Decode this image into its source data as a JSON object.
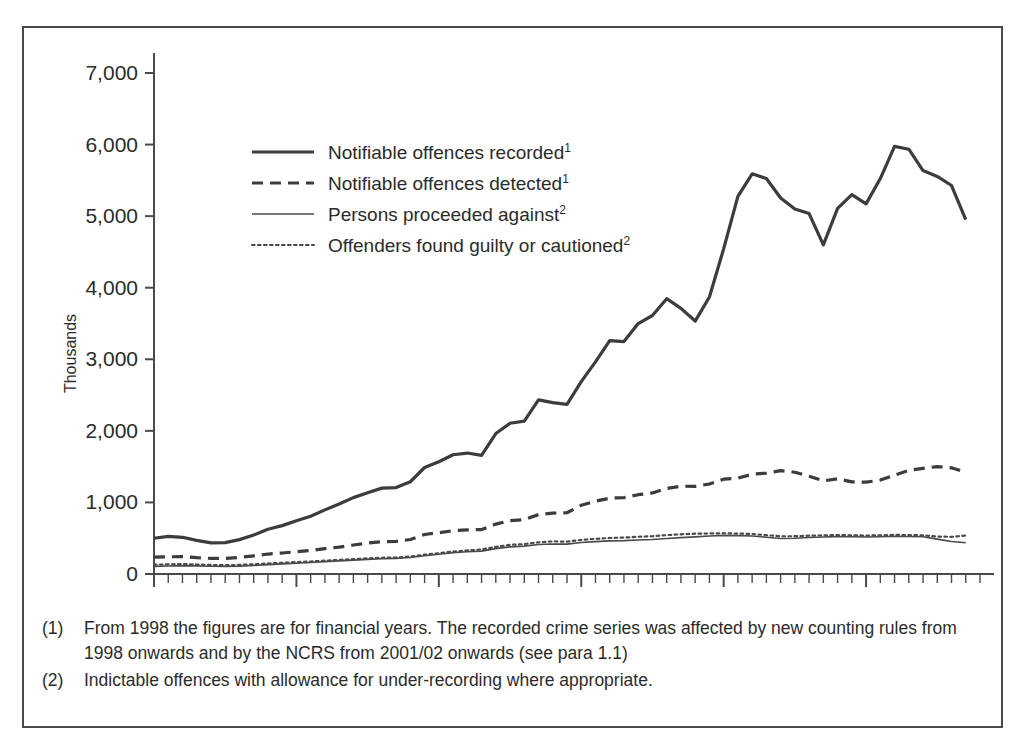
{
  "chart_data": {
    "type": "line",
    "title": "",
    "xlabel": "",
    "ylabel": "Thousands",
    "xlim": [
      1950,
      2008
    ],
    "ylim": [
      0,
      7000
    ],
    "ytick_labels": [
      "0",
      "1,000",
      "2,000",
      "3,000",
      "4,000",
      "5,000",
      "6,000",
      "7,000"
    ],
    "ytick_values": [
      0,
      1000,
      2000,
      3000,
      4000,
      5000,
      6000,
      7000
    ],
    "xtick_labels": [
      "1950",
      "1960",
      "1970",
      "1980",
      "1990",
      "2000"
    ],
    "xtick_values": [
      1950,
      1960,
      1970,
      1980,
      1990,
      2000
    ],
    "xtick_minor_interval": 1,
    "grid": false,
    "legend_position": "upper-left-inside",
    "x": [
      1950,
      1951,
      1952,
      1953,
      1954,
      1955,
      1956,
      1957,
      1958,
      1959,
      1960,
      1961,
      1962,
      1963,
      1964,
      1965,
      1966,
      1967,
      1968,
      1969,
      1970,
      1971,
      1972,
      1973,
      1974,
      1975,
      1976,
      1977,
      1978,
      1979,
      1980,
      1981,
      1982,
      1983,
      1984,
      1985,
      1986,
      1987,
      1988,
      1989,
      1990,
      1991,
      1992,
      1993,
      1994,
      1995,
      1996,
      1997,
      1998,
      1999,
      2000,
      2001,
      2002,
      2003,
      2004,
      2005,
      2006,
      2007
    ],
    "series": [
      {
        "name": "Notifiable offences recorded",
        "footnote": "1",
        "style": "thick-solid",
        "color": "#3c3c3c",
        "width": 3.2,
        "values": [
          500,
          525,
          513,
          470,
          435,
          438,
          480,
          545,
          626,
          676,
          743,
          807,
          896,
          978,
          1067,
          1134,
          1200,
          1208,
          1289,
          1488,
          1568,
          1666,
          1690,
          1658,
          1963,
          2106,
          2136,
          2432,
          2395,
          2370,
          2688,
          2964,
          3262,
          3247,
          3499,
          3612,
          3847,
          3712,
          3534,
          3871,
          4543,
          5276,
          5591,
          5526,
          5253,
          5100,
          5036,
          4598,
          5109,
          5301,
          5171,
          5525,
          5975,
          5935,
          5637,
          5555,
          5428,
          4951
        ]
      },
      {
        "name": "Notifiable offences detected",
        "footnote": "1",
        "style": "thick-dashed",
        "color": "#3c3c3c",
        "width": 3.2,
        "values": [
          235,
          240,
          243,
          228,
          218,
          218,
          232,
          254,
          279,
          293,
          312,
          330,
          354,
          376,
          405,
          432,
          452,
          455,
          482,
          552,
          577,
          605,
          617,
          621,
          697,
          745,
          760,
          830,
          851,
          856,
          960,
          1018,
          1060,
          1068,
          1108,
          1133,
          1195,
          1227,
          1225,
          1258,
          1325,
          1340,
          1394,
          1410,
          1444,
          1422,
          1366,
          1301,
          1331,
          1287,
          1283,
          1312,
          1382,
          1449,
          1476,
          1501,
          1484,
          1419
        ]
      },
      {
        "name": "Persons proceeded against",
        "footnote": "2",
        "style": "thin-solid",
        "color": "#4a4a4a",
        "width": 1.6,
        "values": [
          107,
          112,
          117,
          113,
          108,
          106,
          110,
          119,
          131,
          141,
          151,
          161,
          173,
          184,
          194,
          205,
          213,
          218,
          231,
          256,
          275,
          296,
          311,
          320,
          355,
          379,
          390,
          412,
          420,
          418,
          440,
          452,
          463,
          466,
          475,
          481,
          495,
          508,
          519,
          531,
          540,
          536,
          531,
          513,
          495,
          500,
          510,
          516,
          522,
          520,
          516,
          520,
          527,
          525,
          520,
          487,
          455,
          437
        ]
      },
      {
        "name": "Offenders found guilty or cautioned",
        "footnote": "2",
        "style": "thin-dotted",
        "color": "#4a4a4a",
        "width": 2.2,
        "values": [
          130,
          135,
          139,
          133,
          126,
          123,
          127,
          136,
          147,
          157,
          166,
          175,
          186,
          197,
          208,
          219,
          227,
          231,
          244,
          270,
          291,
          313,
          330,
          342,
          380,
          407,
          418,
          443,
          455,
          452,
          476,
          491,
          503,
          509,
          520,
          528,
          543,
          555,
          563,
          566,
          570,
          565,
          559,
          542,
          527,
          528,
          535,
          540,
          544,
          541,
          537,
          540,
          546,
          544,
          541,
          523,
          519,
          536
        ]
      }
    ],
    "legend": [
      {
        "label": "Notifiable offences recorded",
        "sup": "1",
        "style": "thick-solid"
      },
      {
        "label": "Notifiable offences detected",
        "sup": "1",
        "style": "thick-dashed"
      },
      {
        "label": "Persons proceeded against",
        "sup": "2",
        "style": "thin-solid"
      },
      {
        "label": "Offenders found guilty or cautioned",
        "sup": "2",
        "style": "thin-dotted"
      }
    ]
  },
  "footnotes": [
    {
      "marker": "(1)",
      "text": "From 1998 the figures are for financial years. The recorded crime series was affected by new counting rules from 1998 onwards and by the NCRS from 2001/02 onwards (see para 1.1)"
    },
    {
      "marker": "(2)",
      "text": "Indictable offences with allowance for under-recording where appropriate."
    }
  ],
  "colors": {
    "frame": "#4a4a4a",
    "axis": "#4a4a4a",
    "text": "#2b2b2b",
    "series_dark": "#3c3c3c",
    "series_light": "#4a4a4a"
  }
}
